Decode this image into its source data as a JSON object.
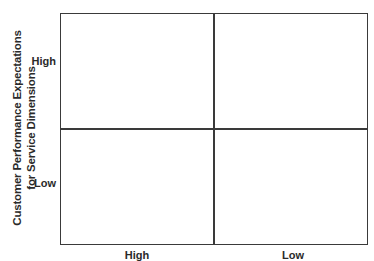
{
  "diagram": {
    "type": "2x2 matrix",
    "y_axis": {
      "title_lines": [
        "Customer Performance Expectations",
        "for Service Dimensions"
      ],
      "ticks": [
        "High",
        "Low"
      ]
    },
    "x_axis": {
      "ticks": [
        "High",
        "Low"
      ]
    },
    "quadrants": [
      {
        "position": "top-left",
        "label": ""
      },
      {
        "position": "top-right",
        "label": ""
      },
      {
        "position": "bottom-left",
        "label": ""
      },
      {
        "position": "bottom-right",
        "label": ""
      }
    ],
    "colors": {
      "line": "#3a3a3a",
      "text": "#2a2a2a",
      "background": "#ffffff"
    }
  }
}
